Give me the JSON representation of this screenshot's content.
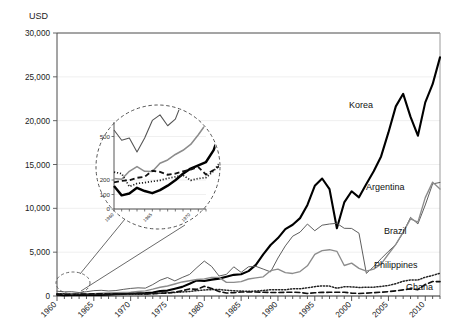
{
  "chart_data": {
    "type": "line",
    "title": "",
    "subtitle": "",
    "ylabel": "USD",
    "xlabel": "",
    "grid": true,
    "legend_position": "inline-right-labels",
    "xlim": [
      1960,
      2012
    ],
    "ylim": [
      0,
      30000
    ],
    "yticks": [
      0,
      5000,
      10000,
      15000,
      20000,
      25000,
      30000
    ],
    "ytick_labels": [
      "0",
      "5,000",
      "10,000",
      "15,000",
      "20,000",
      "25,000",
      "30,000"
    ],
    "xticks": [
      1960,
      1965,
      1970,
      1975,
      1980,
      1985,
      1990,
      1995,
      2000,
      2005,
      2010
    ],
    "xtick_labels": [
      "1960",
      "1965",
      "1970",
      "1975",
      "1980",
      "1985",
      "1990",
      "1995",
      "2000",
      "2005",
      "2010"
    ],
    "x": [
      1960,
      1961,
      1962,
      1963,
      1964,
      1965,
      1966,
      1967,
      1968,
      1969,
      1970,
      1971,
      1972,
      1973,
      1974,
      1975,
      1976,
      1977,
      1978,
      1979,
      1980,
      1981,
      1982,
      1983,
      1984,
      1985,
      1986,
      1987,
      1988,
      1989,
      1990,
      1991,
      1992,
      1993,
      1994,
      1995,
      1996,
      1997,
      1998,
      1999,
      2000,
      2001,
      2002,
      2003,
      2004,
      2005,
      2006,
      2007,
      2008,
      2009,
      2010,
      2011,
      2012
    ],
    "series": [
      {
        "name": "Korea",
        "style": "solid-thick-black",
        "color": "#000000",
        "values": [
          158,
          94,
          107,
          146,
          124,
          109,
          130,
          161,
          198,
          243,
          279,
          301,
          324,
          406,
          563,
          617,
          834,
          1042,
          1398,
          1784,
          1704,
          1870,
          1983,
          2199,
          2413,
          2482,
          2835,
          3554,
          4749,
          5818,
          6610,
          7636,
          8127,
          8884,
          10385,
          12565,
          13403,
          12197,
          7724,
          10672,
          11947,
          11252,
          12784,
          14220,
          15922,
          18658,
          21632,
          23060,
          20431,
          18291,
          22087,
          24156,
          27220
        ]
      },
      {
        "name": "Argentina",
        "style": "solid-thin-gray",
        "color": "#555555",
        "values": [
          545,
          474,
          490,
          393,
          489,
          611,
          649,
          574,
          620,
          754,
          863,
          932,
          895,
          1302,
          1803,
          2108,
          1720,
          2112,
          2461,
          3248,
          3984,
          3368,
          2280,
          2463,
          3328,
          2693,
          3332,
          3383,
          3070,
          2751,
          4334,
          5712,
          6823,
          7283,
          8208,
          7445,
          8077,
          8213,
          8291,
          7724,
          7707,
          7165,
          2580,
          3349,
          4253,
          5093,
          5868,
          7239,
          8970,
          8222,
          10386,
          12788,
          12950
        ]
      },
      {
        "name": "Brazil",
        "style": "solid-gray",
        "color": "#8c8c8c",
        "values": [
          210,
          205,
          260,
          292,
          260,
          259,
          315,
          338,
          376,
          405,
          445,
          512,
          586,
          775,
          1000,
          1140,
          1370,
          1600,
          1740,
          1880,
          1947,
          2133,
          2126,
          1548,
          1548,
          1647,
          1940,
          2063,
          2190,
          2890,
          3072,
          2667,
          2570,
          2790,
          3440,
          4750,
          5170,
          5280,
          5100,
          3480,
          3750,
          3150,
          2830,
          3070,
          3640,
          4790,
          5890,
          7280,
          8790,
          8430,
          11220,
          12990,
          12200
        ]
      },
      {
        "name": "Philippines",
        "style": "dotted",
        "color": "#222222",
        "values": [
          254,
          244,
          155,
          176,
          182,
          190,
          198,
          211,
          222,
          233,
          198,
          210,
          217,
          263,
          334,
          365,
          404,
          456,
          516,
          615,
          685,
          725,
          740,
          661,
          596,
          566,
          532,
          570,
          629,
          709,
          718,
          706,
          818,
          816,
          938,
          1065,
          1160,
          1128,
          885,
          1053,
          1039,
          966,
          1000,
          1010,
          1090,
          1200,
          1410,
          1680,
          1840,
          1830,
          2140,
          2350,
          2590
        ]
      },
      {
        "name": "Ghana",
        "style": "dashed",
        "color": "#111111",
        "values": [
          183,
          194,
          199,
          215,
          222,
          264,
          256,
          236,
          244,
          260,
          272,
          289,
          237,
          269,
          306,
          339,
          440,
          595,
          810,
          760,
          1100,
          860,
          520,
          340,
          380,
          450,
          450,
          450,
          430,
          400,
          400,
          420,
          430,
          400,
          290,
          370,
          410,
          420,
          430,
          430,
          330,
          290,
          320,
          380,
          430,
          500,
          590,
          700,
          820,
          730,
          1320,
          1650,
          1640
        ]
      }
    ],
    "inset": {
      "note": "magnified detail of 1960-1972 region",
      "ylim": [
        0,
        600
      ],
      "yticks": [
        0,
        100,
        200,
        500
      ],
      "ytick_labels": [
        "0",
        "100",
        "200",
        "500"
      ],
      "xtick_labels": [
        "1960",
        "1965",
        "1970"
      ],
      "xlim": [
        1960,
        1972
      ]
    }
  },
  "series_labels": [
    {
      "name": "Korea"
    },
    {
      "name": "Argentina"
    },
    {
      "name": "Brazil"
    },
    {
      "name": "Philippines"
    },
    {
      "name": "Ghana"
    }
  ],
  "axis": {
    "y_axis_title": "USD"
  }
}
